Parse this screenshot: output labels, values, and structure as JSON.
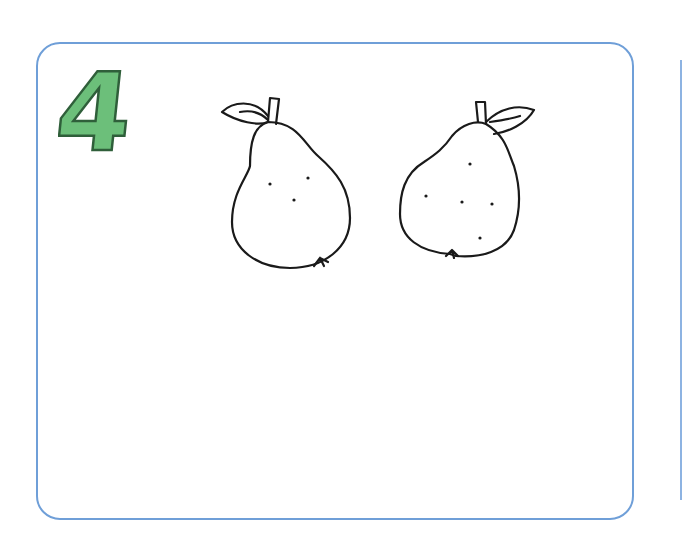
{
  "worksheet": {
    "number_label": "4",
    "number_color": "#6cbf7a",
    "number_outline": "#2f5f3a",
    "border_color": "#6f9fd8",
    "items": [
      {
        "name": "pear",
        "position": "left",
        "leaf_side": "left",
        "dots": 3
      },
      {
        "name": "pear",
        "position": "right",
        "leaf_side": "right",
        "dots": 5
      }
    ]
  }
}
